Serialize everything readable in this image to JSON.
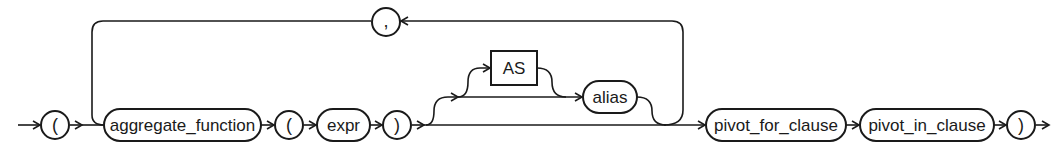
{
  "diagram": {
    "type": "railroad-syntax-diagram",
    "nodes": {
      "open_paren": "(",
      "aggregate_function": "aggregate_function",
      "open_paren_2": "(",
      "expr": "expr",
      "close_paren": ")",
      "as_keyword": "AS",
      "alias": "alias",
      "comma": ",",
      "pivot_for_clause": "pivot_for_clause",
      "pivot_in_clause": "pivot_in_clause",
      "close_paren_final": ")"
    },
    "colors": {
      "stroke": "#1a1a1a",
      "background": "#ffffff"
    }
  }
}
